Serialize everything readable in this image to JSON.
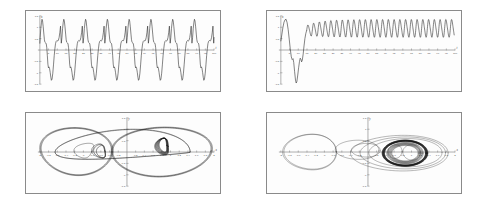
{
  "figure": {
    "title": "",
    "background": "#ffffff",
    "panel_border_color": "#8a8a8a",
    "curve_color": "#1a1a1a",
    "axis_color": "#7a7a7a",
    "panel_count": 4
  },
  "panels": [
    {
      "id": "top-left",
      "name": "time-series-periodic",
      "xlabel": "t",
      "ylabel": "x",
      "xlim": [
        0,
        100
      ],
      "ylim": [
        -1.5,
        1.5
      ],
      "xticks": [
        5,
        10,
        15,
        20,
        25,
        30,
        35,
        40,
        45,
        50,
        55,
        60,
        65,
        70,
        75,
        80,
        85,
        90,
        95,
        100
      ],
      "xticklabels": [
        "5",
        "10",
        "15",
        "20",
        "25",
        "30",
        "35",
        "40",
        "45",
        "50",
        "55",
        "60",
        "65",
        "70",
        "75",
        "80",
        "85",
        "90",
        "95",
        "100"
      ],
      "yticks": [
        -1.5,
        -1.0,
        -0.5,
        0.5,
        1.0,
        1.5
      ],
      "yticklabels": [
        "-1.5",
        "-1",
        "-0.5",
        "0.5",
        "1",
        "1.5"
      ]
    },
    {
      "id": "top-right",
      "name": "time-series-transient-then-oscillation",
      "xlabel": "t",
      "ylabel": "x",
      "xlim": [
        0,
        100
      ],
      "ylim": [
        -1.5,
        1.5
      ],
      "xticks": [
        5,
        10,
        15,
        20,
        25,
        30,
        35,
        40,
        45,
        50,
        55,
        60,
        65,
        70,
        75,
        80,
        85,
        90,
        95,
        100
      ],
      "xticklabels": [
        "5",
        "10",
        "15",
        "20",
        "25",
        "30",
        "35",
        "40",
        "45",
        "50",
        "55",
        "60",
        "65",
        "70",
        "75",
        "80",
        "85",
        "90",
        "95",
        "100"
      ],
      "yticks": [
        -1.5,
        -1.0,
        -0.5,
        0.5,
        1.0,
        1.5
      ],
      "yticklabels": [
        "-1.5",
        "-1",
        "-0.5",
        "0.5",
        "1",
        "1.5"
      ]
    },
    {
      "id": "bottom-left",
      "name": "phase-portrait-double-lobe",
      "xlabel": "x",
      "ylabel": "y",
      "xlim": [
        -2,
        2
      ],
      "ylim": [
        -1.5,
        1.5
      ],
      "xticks": [
        -2,
        -1.8,
        -1.6,
        -1.4,
        -1.2,
        -1,
        -0.8,
        -0.6,
        -0.4,
        -0.2,
        0.2,
        0.4,
        0.6,
        0.8,
        1,
        1.2,
        1.4,
        1.6,
        1.8,
        2
      ],
      "xticklabels": [
        "-2",
        "-1.8",
        "-1.6",
        "-1.4",
        "-1.2",
        "-1",
        "-0.8",
        "-0.6",
        "-0.4",
        "-0.2",
        "0.2",
        "0.4",
        "0.6",
        "0.8",
        "1",
        "1.2",
        "1.4",
        "1.6",
        "1.8",
        "2"
      ],
      "yticks": [
        -1.5,
        -1.0,
        -0.5,
        0.5,
        1.0,
        1.5
      ],
      "yticklabels": [
        "-1.5",
        "-1",
        "-0.5",
        "0.5",
        "1",
        "1.5"
      ]
    },
    {
      "id": "bottom-right",
      "name": "phase-portrait-limit-cycle",
      "xlabel": "x",
      "ylabel": "y",
      "xlim": [
        -2,
        2
      ],
      "ylim": [
        -1.5,
        1.5
      ],
      "xticks": [
        -2,
        -1.8,
        -1.6,
        -1.4,
        -1.2,
        -1,
        -0.8,
        -0.6,
        -0.4,
        -0.2,
        0.2,
        0.4,
        0.6,
        0.8,
        1,
        1.2,
        1.4,
        1.6,
        1.8,
        2
      ],
      "xticklabels": [
        "-2",
        "-1.8",
        "-1.6",
        "-1.4",
        "-1.2",
        "-1",
        "-0.8",
        "-0.6",
        "-0.4",
        "-0.2",
        "0.2",
        "0.4",
        "0.6",
        "0.8",
        "1",
        "1.2",
        "1.4",
        "1.6",
        "1.8",
        "2"
      ],
      "yticks": [
        -1.5,
        -1.0,
        -0.5,
        0.5,
        1.0,
        1.5
      ],
      "yticklabels": [
        "-1.5",
        "-1",
        "-0.5",
        "0.5",
        "1",
        "1.5"
      ]
    }
  ],
  "chart_data": [
    {
      "type": "line",
      "panel": "top-left",
      "title": "",
      "xlabel": "t",
      "ylabel": "x",
      "xlim": [
        0,
        100
      ],
      "ylim": [
        -1.5,
        1.5
      ],
      "grid": false,
      "legend": "none",
      "description": "Periodic relaxation-type waveform, about 8 cycles over t=0..100, period ~12.5. Each cycle: sharp tall peak near +1.35, a shoulder plateau near +0.4, then a deep trough near -1.3 with a secondary step near -0.75.",
      "series": [
        {
          "name": "x(t)",
          "period": 12.5,
          "cycles": 8,
          "peak": 1.35,
          "trough": -1.35,
          "x": [
            0,
            1,
            2,
            3,
            4,
            5,
            6,
            7,
            8,
            9,
            10,
            11,
            12,
            13,
            14,
            15,
            16,
            17,
            18,
            19,
            20,
            21,
            22,
            23,
            24,
            25
          ],
          "values": [
            0.35,
            0.6,
            1.0,
            1.32,
            1.25,
            0.75,
            0.35,
            0.3,
            -0.15,
            -0.8,
            -0.72,
            -0.95,
            -1.3,
            -0.85,
            -0.1,
            0.35,
            0.45,
            0.6,
            1.05,
            1.33,
            1.2,
            0.7,
            0.33,
            0.28,
            -0.2,
            -0.82
          ]
        }
      ]
    },
    {
      "type": "line",
      "panel": "top-right",
      "title": "",
      "xlabel": "t",
      "ylabel": "x",
      "xlim": [
        0,
        100
      ],
      "ylim": [
        -1.5,
        1.5
      ],
      "grid": false,
      "legend": "none",
      "description": "Initial transient: rises to ~1.35 near t=3, falls steeply to about -1.45 near t=8, recovers with a small wiggle near t=11, then settles into sustained high-frequency oscillation between about 0.55 and 1.3 centered near 0.95 for the rest of the record.",
      "series": [
        {
          "name": "x(t)",
          "transient_peak": 1.35,
          "transient_min": -1.45,
          "steady_center": 0.95,
          "steady_amplitude": 0.38,
          "steady_period": 3.3,
          "x": [
            0,
            1,
            2,
            3,
            4,
            5,
            6,
            7,
            8,
            9,
            10,
            11,
            12,
            13,
            14,
            15,
            16,
            17,
            18,
            19,
            20
          ],
          "values": [
            0.45,
            0.85,
            1.2,
            1.35,
            1.05,
            0.4,
            -0.35,
            -1.0,
            -1.45,
            -1.1,
            -0.55,
            -0.35,
            -0.5,
            0.05,
            0.55,
            0.9,
            1.25,
            0.8,
            0.62,
            1.05,
            1.28
          ]
        }
      ]
    },
    {
      "type": "line",
      "panel": "bottom-left",
      "title": "",
      "xlabel": "x",
      "ylabel": "y",
      "xlim": [
        -2,
        2
      ],
      "ylim": [
        -1.5,
        1.5
      ],
      "grid": false,
      "legend": "none",
      "description": "Phase-plane trajectory forming a large asymmetric double-lobe (figure-eight-like) orbit. Left lobe spans roughly x=-1.95..-0.35 and the right lobe spans roughly x=-0.4..1.95, crossing near x=-0.35. Two small teardrop loops sit near x=-1.2..-0.55 close to the horizontal axis, and a dense knot of overlapping passes occurs near x=0.85.",
      "features": {
        "left_lobe_x": [
          -1.95,
          -0.35
        ],
        "right_lobe_x": [
          -0.4,
          1.95
        ],
        "lobe_top_y": 1.15,
        "lobe_bottom_y": -1.15,
        "inner_loops": 2,
        "dense_knot_x": 0.85
      }
    },
    {
      "type": "line",
      "panel": "bottom-right",
      "title": "",
      "xlabel": "x",
      "ylabel": "y",
      "xlim": [
        -2,
        2
      ],
      "ylim": [
        -1.5,
        1.5
      ],
      "grid": false,
      "legend": "none",
      "description": "Phase-plane trajectory showing a single wide transient excursion looping through the left half plane (down to about x=-1.95) and pinching near x=-0.75, then spiralling into a dense, heavily overdrawn near-circular limit cycle centred near x=0.85 with radius about 0.5 in x and 0.55 in y.",
      "features": {
        "transient_left_extent": -1.95,
        "pinch_point_x": -0.75,
        "attractor_center": [
          0.85,
          -0.05
        ],
        "attractor_radius_x": 0.5,
        "attractor_radius_y": 0.55,
        "outer_transient_extent_x": 1.85
      }
    }
  ]
}
